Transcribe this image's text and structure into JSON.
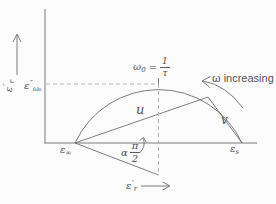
{
  "figure": {
    "kind": "cole-cole-relaxation-diagram",
    "colors": {
      "background": "#fcfcfc",
      "line": "#6e6e6e",
      "dashed": "#b0b0b0",
      "text": "#4f4f4f"
    },
    "y_axis_label": {
      "symbol": "ε",
      "prime": "″",
      "subscript": "r"
    },
    "y_value_label": {
      "symbol": "ε",
      "prime": "″",
      "subscript": "ω₀"
    },
    "x_axis_label": {
      "symbol": "ε",
      "prime": "′",
      "subscript": "r"
    },
    "peak_label": {
      "symbol": "ω",
      "subscript": "0",
      "equals": "=",
      "fraction": {
        "numerator": "1",
        "denominator": "τ"
      }
    },
    "omega_direction_label": "ω increasing",
    "chord_labels": {
      "u": "u",
      "v": "v"
    },
    "point_labels": {
      "eps_infinity": {
        "symbol": "ε",
        "subscript": "∞"
      },
      "eps_static": {
        "symbol": "ε",
        "subscript": "s"
      }
    },
    "angle_label": {
      "coefficient": "α",
      "fraction": {
        "numerator": "π",
        "denominator": "2"
      }
    }
  }
}
